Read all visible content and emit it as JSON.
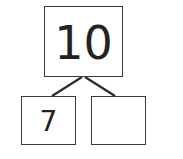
{
  "number_bond": {
    "whole": "10",
    "parts": [
      {
        "value": "7"
      },
      {
        "value": ""
      }
    ]
  },
  "colors": {
    "stroke": "#2b2b2b",
    "text": "#222222",
    "background": "#ffffff"
  }
}
